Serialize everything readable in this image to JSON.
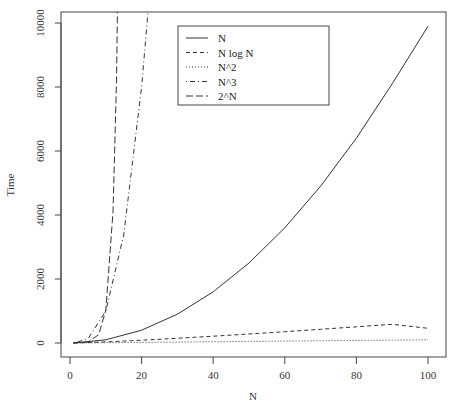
{
  "chart_data": {
    "type": "line",
    "title": "",
    "xlabel": "N",
    "ylabel": "Time",
    "xlim": [
      0,
      100
    ],
    "ylim": [
      0,
      10000
    ],
    "grid": false,
    "legend_position": "top-center",
    "x_ticks": [
      "0",
      "20",
      "40",
      "60",
      "80",
      "100"
    ],
    "y_ticks": [
      "0",
      "2000",
      "4000",
      "6000",
      "8000",
      "10000"
    ],
    "legend": [
      {
        "label": "N",
        "style": "solid"
      },
      {
        "label": "N log N",
        "style": "dashed"
      },
      {
        "label": "N^2",
        "style": "dotted"
      },
      {
        "label": "N^3",
        "style": "dotdash"
      },
      {
        "label": "2^N",
        "style": "longdash"
      }
    ],
    "series": [
      {
        "name": "solid curve",
        "style": "solid",
        "x": [
          1,
          10,
          20,
          30,
          40,
          50,
          60,
          70,
          80,
          90,
          100
        ],
        "values": [
          1,
          100,
          400,
          900,
          1600,
          2500,
          3600,
          4900,
          6400,
          8100,
          9900
        ]
      },
      {
        "name": "dashed curve",
        "style": "dashed",
        "x": [
          1,
          10,
          20,
          30,
          40,
          50,
          60,
          70,
          80,
          90,
          100
        ],
        "values": [
          0,
          33,
          86,
          147,
          213,
          282,
          354,
          429,
          506,
          584,
          460
        ]
      },
      {
        "name": "dotted curve",
        "style": "dotted",
        "x": [
          1,
          100
        ],
        "values": [
          1,
          100
        ]
      },
      {
        "name": "dotdash curve",
        "style": "dotdash",
        "x": [
          1,
          5,
          10,
          15,
          20,
          22
        ],
        "values": [
          1,
          125,
          1000,
          3375,
          8000,
          10648
        ]
      },
      {
        "name": "longdash curve",
        "style": "longdash",
        "x": [
          1,
          5,
          8,
          10,
          12,
          13,
          14
        ],
        "values": [
          2,
          32,
          256,
          1024,
          4096,
          8192,
          16384
        ]
      }
    ]
  }
}
